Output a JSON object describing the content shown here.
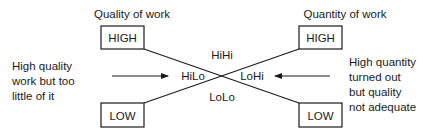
{
  "left_axis": {
    "title": "Quality of work",
    "high_label": "HIGH",
    "low_label": "LOW"
  },
  "right_axis": {
    "title": "Quantity of work",
    "high_label": "HIGH",
    "low_label": "LOW"
  },
  "quadrants": {
    "top": "HiHi",
    "bottom": "LoLo",
    "left": "HiLo",
    "right": "LoHi"
  },
  "left_annotation": [
    "High quality",
    "work but too",
    "little of it"
  ],
  "right_annotation": [
    "High quantity",
    "turned out",
    "but quality",
    "not adequate"
  ],
  "colors": {
    "ink": "#1a1a1a",
    "background": "#ffffff"
  }
}
